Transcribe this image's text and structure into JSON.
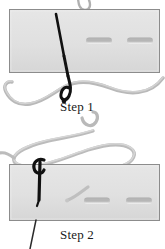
{
  "figure": {
    "background_color": "#ffffff"
  },
  "steps": [
    {
      "id": "step-1",
      "caption": "Step 1",
      "description": "Needle pushed down through fabric, thread trailing below"
    },
    {
      "id": "step-2",
      "caption": "Step 2",
      "description": "Needle pulled back up through fabric forming a loop of thread above"
    }
  ],
  "elements": {
    "fabric_label": "fabric-panel",
    "needle_label": "needle",
    "thread_label": "thread",
    "stitch_hole_label": "stitch-hole"
  },
  "colors": {
    "fabric_fill": "#dedede",
    "fabric_fill_light": "#e8e8e8",
    "fabric_border": "#8a8a8a",
    "thread": "#b4b4b4",
    "thread_shadow": "#9a9a9a",
    "needle": "#111111",
    "hole_dark": "#a8a8a8",
    "hole_light": "#f2f2f2",
    "text": "#1a1a1a"
  },
  "fabric_panels": [
    {
      "id": "panel-top",
      "x": 9,
      "y": 9,
      "width": 151,
      "height": 64
    },
    {
      "id": "panel-bottom",
      "x": 9,
      "y": 164,
      "width": 151,
      "height": 57
    }
  ],
  "stitch_holes": [
    {
      "panel": "panel-top",
      "x": 86,
      "y": 38,
      "width": 26,
      "height": 7
    },
    {
      "panel": "panel-top",
      "x": 127,
      "y": 38,
      "width": 26,
      "height": 7
    },
    {
      "panel": "panel-bottom",
      "x": 84,
      "y": 198,
      "width": 26,
      "height": 7
    },
    {
      "panel": "panel-bottom",
      "x": 126,
      "y": 198,
      "width": 26,
      "height": 7
    }
  ]
}
